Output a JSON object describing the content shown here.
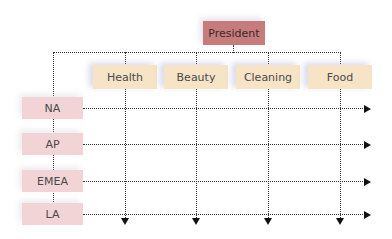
{
  "diagram": {
    "title_node": {
      "label": "President",
      "color": "#c67b7d"
    },
    "columns": [
      {
        "label": "Health"
      },
      {
        "label": "Beauty"
      },
      {
        "label": "Cleaning"
      },
      {
        "label": "Food"
      }
    ],
    "rows": [
      {
        "label": "NA"
      },
      {
        "label": "AP"
      },
      {
        "label": "EMEA"
      },
      {
        "label": "LA"
      }
    ],
    "colors": {
      "column_fill": "#f7e3c6",
      "row_fill": "#f2d3d6",
      "connector": "#333333"
    },
    "type": "matrix-organization-chart"
  }
}
